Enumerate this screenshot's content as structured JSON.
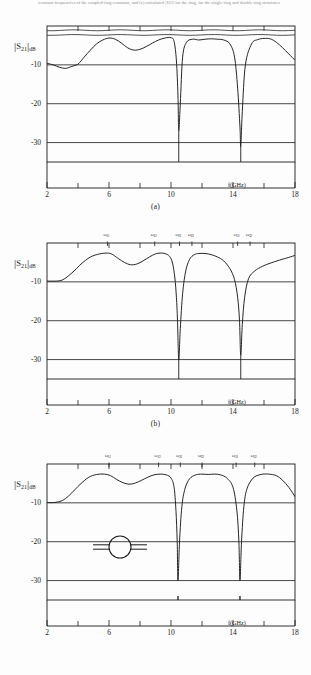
{
  "page": {
    "header_fragment": "resonant frequencies of the coupled-ring resonator, and (c) calculated |S21| for the ring, for the single-ring and double-ring structures",
    "background": "#fdfdfd",
    "line_color": "#1a1a1a"
  },
  "axes": {
    "ylabel_symbol": "S",
    "ylabel_sub": "21",
    "ylabel_unit": "dB",
    "y_ticks": [
      "-10",
      "-20",
      "-30"
    ],
    "y_values": [
      -10,
      -20,
      -30
    ],
    "ylim": [
      0,
      -35
    ],
    "x_ticks": [
      "2",
      "6",
      "10",
      "14",
      "18"
    ],
    "x_values": [
      2,
      6,
      10,
      14,
      18
    ],
    "x_minor": [
      4,
      8,
      12,
      16
    ],
    "xlim": [
      2,
      18
    ],
    "xlabel": "f(GHz)"
  },
  "captions": {
    "a": "(a)",
    "b": "(b)",
    "c": "(c)"
  },
  "inset": {
    "name": "ring-resonator-symbol",
    "description": "ring resonator with two coupled feed lines"
  },
  "chart_data": [
    {
      "id": "panel-a",
      "type": "line",
      "title": "(a)",
      "xlabel": "f(GHz)",
      "ylabel": "|S21| dB",
      "xlim": [
        2,
        18
      ],
      "ylim": [
        -35,
        0
      ],
      "grid": false,
      "measured": true,
      "series": [
        {
          "name": "|S21| measured",
          "x": [
            2.0,
            2.4,
            2.8,
            3.2,
            3.6,
            4.0,
            4.4,
            4.8,
            5.2,
            5.6,
            6.0,
            6.4,
            6.8,
            7.2,
            7.6,
            8.0,
            8.4,
            8.8,
            9.2,
            9.6,
            10.0,
            10.2,
            10.35,
            10.45,
            10.5,
            10.6,
            10.75,
            11.0,
            11.4,
            11.8,
            12.2,
            12.6,
            13.0,
            13.4,
            13.8,
            14.1,
            14.3,
            14.45,
            14.5,
            14.6,
            14.8,
            15.2,
            15.6,
            16.0,
            16.4,
            16.8,
            17.2,
            17.6,
            18.0
          ],
          "y": [
            -9.6,
            -10.0,
            -10.6,
            -10.9,
            -10.4,
            -9.8,
            -8.0,
            -6.2,
            -4.6,
            -3.6,
            -3.1,
            -3.4,
            -4.4,
            -5.6,
            -6.2,
            -6.0,
            -5.3,
            -4.4,
            -3.6,
            -3.1,
            -3.0,
            -4.0,
            -9.0,
            -18.0,
            -27.0,
            -20.0,
            -8.0,
            -4.2,
            -3.4,
            -3.6,
            -3.4,
            -3.3,
            -3.4,
            -3.6,
            -4.6,
            -8.0,
            -16.0,
            -26.0,
            -31.0,
            -22.0,
            -10.0,
            -4.6,
            -3.5,
            -3.2,
            -3.3,
            -4.2,
            -5.6,
            -7.2,
            -8.8
          ]
        }
      ],
      "notches": [
        {
          "f": 10.5,
          "depth": -27
        },
        {
          "f": 14.5,
          "depth": -31
        }
      ]
    },
    {
      "id": "panel-b",
      "type": "line",
      "title": "(b)",
      "xlabel": "f(GHz)",
      "ylabel": "|S21| dB",
      "xlim": [
        2,
        18
      ],
      "ylim": [
        -35,
        0
      ],
      "grid": false,
      "measured": false,
      "series": [
        {
          "name": "|S21| calculated single ring",
          "x": [
            2.0,
            2.6,
            3.0,
            3.4,
            3.8,
            4.2,
            4.8,
            5.4,
            5.9,
            6.2,
            6.6,
            7.0,
            7.4,
            7.8,
            8.2,
            8.6,
            9.0,
            9.3,
            9.6,
            9.9,
            10.1,
            10.25,
            10.35,
            10.42,
            10.5,
            10.6,
            10.75,
            10.95,
            11.2,
            11.5,
            11.8,
            12.2,
            12.6,
            13.0,
            13.4,
            13.8,
            14.1,
            14.3,
            14.42,
            14.5,
            14.6,
            14.75,
            15.0,
            15.4,
            15.9,
            16.4,
            17.0,
            17.6,
            18.0
          ],
          "y": [
            -9.8,
            -9.8,
            -9.5,
            -8.4,
            -7.0,
            -5.4,
            -3.6,
            -2.8,
            -2.6,
            -2.9,
            -4.0,
            -5.0,
            -5.6,
            -5.4,
            -4.6,
            -3.6,
            -2.8,
            -2.6,
            -2.7,
            -3.4,
            -5.2,
            -9.0,
            -14.0,
            -20.0,
            -30.0,
            -22.0,
            -13.0,
            -7.2,
            -4.2,
            -3.0,
            -2.7,
            -2.7,
            -3.0,
            -3.6,
            -4.6,
            -6.6,
            -9.4,
            -14.0,
            -20.0,
            -29.0,
            -21.0,
            -14.0,
            -9.2,
            -7.2,
            -6.0,
            -5.2,
            -4.4,
            -3.7,
            -3.2
          ]
        }
      ],
      "notches": [
        {
          "f": 10.5,
          "depth": -30
        },
        {
          "f": 14.5,
          "depth": -29
        }
      ],
      "markers": [
        {
          "label": "ω",
          "sub": "11",
          "f": 5.9
        },
        {
          "label": "ω",
          "sub": "12",
          "f": 8.95
        },
        {
          "label": "ω",
          "sub": "21",
          "f": 10.55
        },
        {
          "label": "ω",
          "sub": "22",
          "f": 11.35
        },
        {
          "label": "ω",
          "sub": "31",
          "f": 14.3
        },
        {
          "label": "ω",
          "sub": "32",
          "f": 15.1
        }
      ]
    },
    {
      "id": "panel-c",
      "type": "line",
      "title": "(c)",
      "xlabel": "f(GHz)",
      "ylabel": "|S21| dB",
      "xlim": [
        2,
        18
      ],
      "ylim": [
        -35,
        0
      ],
      "grid": false,
      "measured": false,
      "series": [
        {
          "name": "|S21| calculated coupled ring",
          "x": [
            2.0,
            2.5,
            3.0,
            3.4,
            3.8,
            4.2,
            4.7,
            5.2,
            5.7,
            6.1,
            6.5,
            6.9,
            7.3,
            7.7,
            8.1,
            8.5,
            8.9,
            9.3,
            9.7,
            10.0,
            10.2,
            10.32,
            10.4,
            10.45,
            10.55,
            10.7,
            10.9,
            11.2,
            11.6,
            12.0,
            12.4,
            12.8,
            13.2,
            13.6,
            14.0,
            14.25,
            14.38,
            14.45,
            14.55,
            14.7,
            14.9,
            15.3,
            15.8,
            16.3,
            16.8,
            17.2,
            17.6,
            18.0
          ],
          "y": [
            -9.9,
            -9.9,
            -9.4,
            -8.2,
            -6.6,
            -5.0,
            -3.4,
            -2.7,
            -2.6,
            -3.0,
            -4.0,
            -4.8,
            -5.2,
            -4.9,
            -4.2,
            -3.4,
            -2.8,
            -2.6,
            -2.8,
            -3.6,
            -6.0,
            -12.0,
            -20.0,
            -30.0,
            -20.0,
            -11.0,
            -6.4,
            -3.8,
            -2.8,
            -2.6,
            -2.7,
            -2.6,
            -2.8,
            -3.6,
            -6.0,
            -12.0,
            -20.0,
            -30.0,
            -20.0,
            -11.0,
            -6.4,
            -3.6,
            -2.7,
            -2.6,
            -3.0,
            -4.2,
            -6.0,
            -8.4
          ]
        }
      ],
      "notches": [
        {
          "f": 10.45,
          "depth": -34
        },
        {
          "f": 14.45,
          "depth": -34
        }
      ],
      "markers": [
        {
          "label": "ω",
          "sub": "11",
          "f": 6.0
        },
        {
          "label": "ω",
          "sub": "12",
          "f": 9.2
        },
        {
          "label": "ω",
          "sub": "21",
          "f": 10.6
        },
        {
          "label": "ω",
          "sub": "22",
          "f": 12.0
        },
        {
          "label": "ω",
          "sub": "31",
          "f": 14.2
        },
        {
          "label": "ω",
          "sub": "32",
          "f": 15.4
        }
      ]
    }
  ]
}
